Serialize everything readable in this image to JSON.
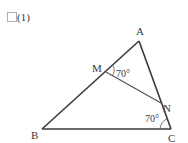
{
  "problem": {
    "checkbox_icon": "empty-square",
    "number": "(1)"
  },
  "diagram": {
    "points": {
      "A": {
        "label": "A",
        "x": 139,
        "y": 41
      },
      "B": {
        "label": "B",
        "x": 42,
        "y": 129
      },
      "C": {
        "label": "C",
        "x": 171,
        "y": 129
      },
      "M": {
        "label": "M",
        "x": 106,
        "y": 72
      },
      "N": {
        "label": "N",
        "x": 161,
        "y": 103
      }
    },
    "segments": [
      "AB",
      "BC",
      "CA",
      "MN"
    ],
    "angles": [
      {
        "vertex": "M",
        "between": [
          "MA",
          "MN"
        ],
        "value": "70°"
      },
      {
        "vertex": "C",
        "between": [
          "CB",
          "CA"
        ],
        "value": "70°"
      }
    ],
    "stroke_color": "#3a3a3a"
  }
}
